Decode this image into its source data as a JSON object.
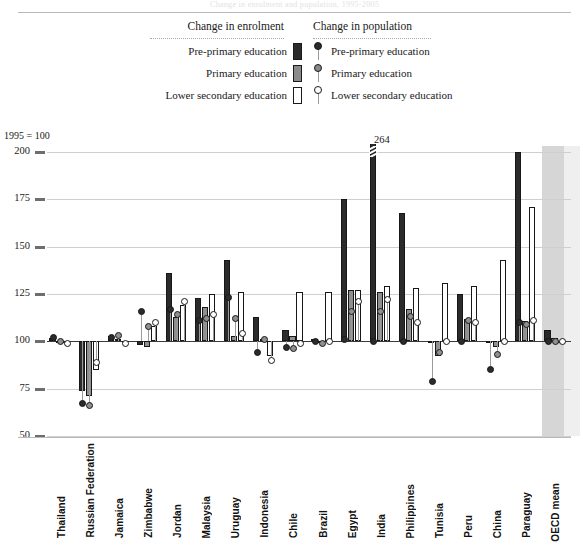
{
  "figure": {
    "cut_title": "Change in enrolment and population, 1995-2005",
    "axis_note": "1995 = 100"
  },
  "legend": {
    "enrolment": {
      "heading": "Change in enrolment",
      "items": [
        {
          "label": "Pre-primary education",
          "marker": "bar-dark-swatch",
          "color": "#2b2b2b"
        },
        {
          "label": "Primary education",
          "marker": "bar-mid-swatch",
          "color": "#8a8a8a"
        },
        {
          "label": "Lower secondary education",
          "marker": "bar-light-swatch",
          "color": "#ffffff"
        }
      ]
    },
    "population": {
      "heading": "Change in population",
      "items": [
        {
          "label": "Pre-primary education",
          "marker": "pin-dark-icon",
          "color": "#2b2b2b"
        },
        {
          "label": "Primary education",
          "marker": "pin-mid-icon",
          "color": "#8a8a8a"
        },
        {
          "label": "Lower secondary education",
          "marker": "pin-open-icon",
          "color": "#ffffff"
        }
      ]
    }
  },
  "chart_data": {
    "type": "bar",
    "title": "",
    "xlabel": "",
    "ylabel": "1995 = 100",
    "ylim": [
      50,
      200
    ],
    "yticks": [
      50,
      75,
      100,
      125,
      150,
      175,
      200
    ],
    "grid": true,
    "baseline": 100,
    "legend_position": "top-center",
    "annotations": [
      {
        "text": "264",
        "category": "India",
        "series": "Pre-primary education (enrolment)",
        "value": 264
      }
    ],
    "categories": [
      "Thailand",
      "Russian Federation",
      "Jamaica",
      "Zimbabwe",
      "Jordan",
      "Malaysia",
      "Uruguay",
      "Indonesia",
      "Chile",
      "Brazil",
      "Egypt",
      "India",
      "Philippines",
      "Tunisia",
      "Peru",
      "China",
      "Paraguay",
      "OECD mean"
    ],
    "series": [
      {
        "name": "Pre-primary education",
        "kind": "bar",
        "color": "#2b2b2b",
        "values": [
          102,
          74,
          103,
          98,
          136,
          123,
          143,
          113,
          106,
          101,
          175,
          264,
          168,
          100,
          125,
          100,
          200,
          106
        ]
      },
      {
        "name": "Primary education",
        "kind": "bar",
        "color": "#8f8f8f",
        "values": [
          100,
          71,
          101,
          97,
          113,
          118,
          103,
          101,
          103,
          100,
          127,
          126,
          117,
          92,
          112,
          97,
          111,
          102
        ]
      },
      {
        "name": "Lower secondary education",
        "kind": "bar",
        "color": "#ffffff",
        "values": [
          100,
          85,
          100,
          108,
          119,
          125,
          126,
          92,
          126,
          126,
          127,
          129,
          128,
          131,
          129,
          143,
          171,
          100
        ]
      },
      {
        "name": "Pre-primary education (population)",
        "kind": "marker",
        "color": "#2b2b2b",
        "values": [
          102,
          67,
          102,
          116,
          117,
          111,
          123,
          94,
          97,
          100,
          101,
          100,
          100,
          79,
          100,
          85,
          110,
          100
        ]
      },
      {
        "name": "Primary education (population)",
        "kind": "marker",
        "color": "#8f8f8f",
        "values": [
          100,
          66,
          103,
          108,
          114,
          112,
          112,
          101,
          96,
          99,
          116,
          116,
          113,
          94,
          111,
          93,
          109,
          100
        ]
      },
      {
        "name": "Lower secondary education (population)",
        "kind": "marker",
        "color": "#ffffff",
        "values": [
          99,
          89,
          99,
          110,
          121,
          114,
          104,
          90,
          99,
          100,
          121,
          122,
          110,
          100,
          110,
          100,
          111,
          100
        ]
      }
    ]
  }
}
